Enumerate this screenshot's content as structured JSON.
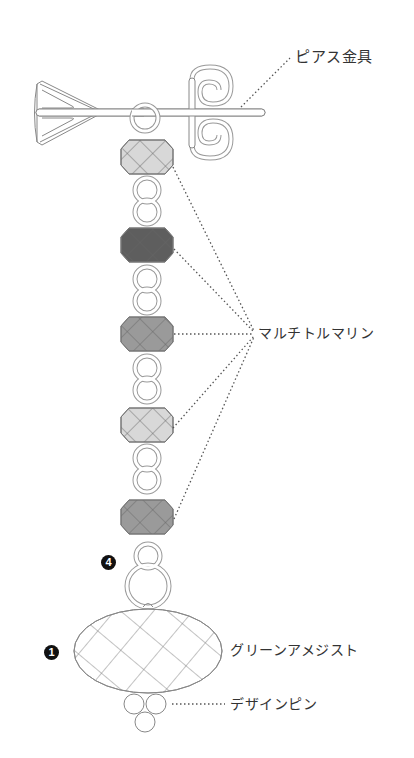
{
  "diagram": {
    "type": "earring-assembly-illustration",
    "colors": {
      "background": "#ffffff",
      "line": "#888888",
      "leader_line": "#555555",
      "bead_light": "#d8d8d8",
      "bead_medium": "#9a9a9a",
      "bead_dark": "#5e5e5e",
      "text": "#333333",
      "badge": "#111111"
    },
    "labels": {
      "earring_fitting": "ピアス金具",
      "multi_tourmaline": "マルチトルマリン",
      "green_amethyst": "グリーンアメジスト",
      "design_pin": "デザインピン"
    },
    "badges": {
      "step_4": "4",
      "step_1": "1"
    },
    "beads": [
      {
        "name": "multi-tourmaline-1",
        "shade": "light"
      },
      {
        "name": "multi-tourmaline-2",
        "shade": "dark"
      },
      {
        "name": "multi-tourmaline-3",
        "shade": "medium"
      },
      {
        "name": "multi-tourmaline-4",
        "shade": "light"
      },
      {
        "name": "multi-tourmaline-5",
        "shade": "medium"
      }
    ]
  }
}
